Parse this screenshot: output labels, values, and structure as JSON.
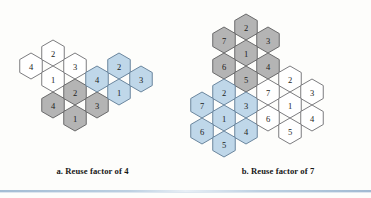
{
  "figure": {
    "background_color": "#fdfdfb",
    "rule_color": "#9fb9d2"
  },
  "palette": {
    "white": "#ffffff",
    "gray": "#b4b4b4",
    "blue": "#bfd7e9",
    "stroke": "#58585a",
    "text": "#1b1b1b"
  },
  "panels": [
    {
      "id": "reuse-4",
      "caption": "a. Reuse factor of 4",
      "hex_radius": 13.0,
      "clusters": [
        {
          "name": "cluster-white",
          "fill": "white",
          "cells": [
            {
              "label": "4",
              "cx": 31,
              "cy": 66
            },
            {
              "label": "2",
              "cx": 53,
              "cy": 53
            },
            {
              "label": "1",
              "cx": 53,
              "cy": 79
            },
            {
              "label": "3",
              "cx": 75,
              "cy": 66
            }
          ]
        },
        {
          "name": "cluster-gray",
          "fill": "gray",
          "cells": [
            {
              "label": "4",
              "cx": 53,
              "cy": 105
            },
            {
              "label": "2",
              "cx": 75,
              "cy": 92
            },
            {
              "label": "1",
              "cx": 75,
              "cy": 118
            },
            {
              "label": "3",
              "cx": 97,
              "cy": 105
            }
          ]
        },
        {
          "name": "cluster-blue",
          "fill": "blue",
          "cells": [
            {
              "label": "4",
              "cx": 97,
              "cy": 79
            },
            {
              "label": "2",
              "cx": 119,
              "cy": 66
            },
            {
              "label": "1",
              "cx": 119,
              "cy": 92
            },
            {
              "label": "3",
              "cx": 141,
              "cy": 79
            }
          ]
        }
      ]
    },
    {
      "id": "reuse-7",
      "caption": "b. Reuse factor of 7",
      "hex_radius": 13.0,
      "clusters": [
        {
          "name": "cluster-gray",
          "fill": "gray",
          "cells": [
            {
              "label": "2",
              "cx": 61,
              "cy": 27
            },
            {
              "label": "7",
              "cx": 39,
              "cy": 40
            },
            {
              "label": "3",
              "cx": 83,
              "cy": 40
            },
            {
              "label": "1",
              "cx": 61,
              "cy": 53
            },
            {
              "label": "6",
              "cx": 39,
              "cy": 66
            },
            {
              "label": "4",
              "cx": 83,
              "cy": 66
            },
            {
              "label": "5",
              "cx": 61,
              "cy": 79
            }
          ]
        },
        {
          "name": "cluster-blue",
          "fill": "blue",
          "cells": [
            {
              "label": "2",
              "cx": 39,
              "cy": 92
            },
            {
              "label": "7",
              "cx": 17,
              "cy": 105
            },
            {
              "label": "3",
              "cx": 61,
              "cy": 105
            },
            {
              "label": "1",
              "cx": 39,
              "cy": 118
            },
            {
              "label": "6",
              "cx": 17,
              "cy": 131
            },
            {
              "label": "4",
              "cx": 61,
              "cy": 131
            },
            {
              "label": "5",
              "cx": 39,
              "cy": 144
            }
          ]
        },
        {
          "name": "cluster-white",
          "fill": "white",
          "cells": [
            {
              "label": "2",
              "cx": 105,
              "cy": 79
            },
            {
              "label": "7",
              "cx": 83,
              "cy": 92
            },
            {
              "label": "3",
              "cx": 127,
              "cy": 92
            },
            {
              "label": "1",
              "cx": 105,
              "cy": 105
            },
            {
              "label": "6",
              "cx": 83,
              "cy": 118
            },
            {
              "label": "4",
              "cx": 127,
              "cy": 118
            },
            {
              "label": "5",
              "cx": 105,
              "cy": 131
            }
          ]
        }
      ]
    }
  ]
}
